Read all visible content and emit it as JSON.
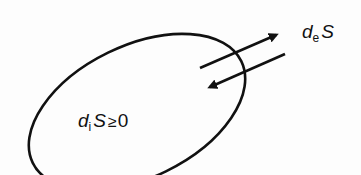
{
  "diagram": {
    "type": "entropy-system",
    "system_boundary": {
      "shape": "ellipse",
      "stroke": "#111111"
    },
    "arrows": [
      {
        "id": "outflow",
        "direction": "out",
        "label_ref": "exchange"
      },
      {
        "id": "inflow",
        "direction": "in",
        "label_ref": "exchange"
      }
    ],
    "labels": {
      "exchange": {
        "d": "d",
        "sub": "e",
        "var": "S"
      },
      "internal": {
        "d": "d",
        "sub": "i",
        "var": "S",
        "relation": "≥",
        "value": "0"
      }
    }
  }
}
